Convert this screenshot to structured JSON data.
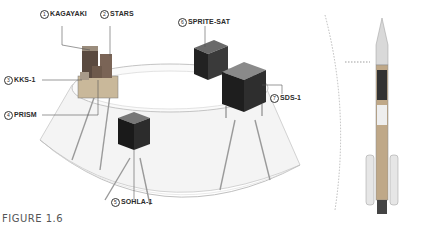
{
  "figure": {
    "caption": "FIGURE 1.6"
  },
  "satellites": [
    {
      "num": "1",
      "name": "KAGAYAKI"
    },
    {
      "num": "2",
      "name": "STARS"
    },
    {
      "num": "3",
      "name": "KKS-1"
    },
    {
      "num": "4",
      "name": "PRISM"
    },
    {
      "num": "5",
      "name": "SOHLA-1"
    },
    {
      "num": "6",
      "name": "SPRITE-SAT"
    },
    {
      "num": "7",
      "name": "SDS-1"
    }
  ],
  "colors": {
    "satellite_body": "#1e1e1e",
    "fairing_line": "#b8b8b8",
    "leader_line": "#666666",
    "caption": "#555555"
  }
}
